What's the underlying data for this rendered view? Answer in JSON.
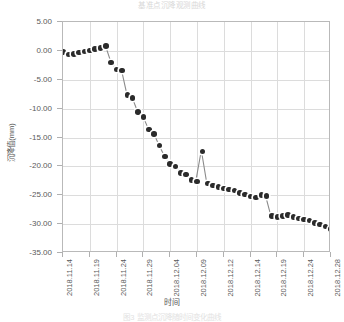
{
  "figure": {
    "title": "基准点沉降观测曲线",
    "caption": "图3 监测点沉降随时间变化曲线"
  },
  "axes": {
    "y_title": "沉降值(mm)",
    "x_title": "时间",
    "y_ticks": [
      "5.00",
      "0.00",
      "-5.00",
      "-10.00",
      "-15.00",
      "-20.00",
      "-25.00",
      "-30.00",
      "-35.00"
    ],
    "x_ticks": [
      "2018.11.14",
      "2018.11.19",
      "2018.11.24",
      "2018.11.29",
      "2018.12.04",
      "2018.12.09",
      "2018.12.12",
      "2018.12.14",
      "2018.12.19",
      "2018.12.24",
      "2018.12.28"
    ]
  },
  "style": {
    "marker_color": "#2b2b2b",
    "line_color": "#8a8a8a",
    "grid_color": "#dcdcdc",
    "frame_color": "#b9b9b9"
  },
  "chart_data": {
    "type": "scatter",
    "title": "基准点沉降观测曲线",
    "xlabel": "时间",
    "ylabel": "沉降值(mm)",
    "ylim": [
      -35.0,
      5.0
    ],
    "ytick_step": 5.0,
    "grid": true,
    "legend": "none",
    "categories": [
      "2018.11.14",
      "2018.11.19",
      "2018.11.24",
      "2018.11.29",
      "2018.12.04",
      "2018.12.09",
      "2018.12.12",
      "2018.12.14",
      "2018.12.19",
      "2018.12.24",
      "2018.12.28"
    ],
    "xlim": [
      0,
      50
    ],
    "series": [
      {
        "name": "沉降值",
        "x": [
          0,
          1,
          2,
          3,
          4,
          5,
          6,
          7,
          8,
          9,
          10,
          11,
          12,
          13,
          14,
          15,
          16,
          17,
          18,
          19,
          20,
          21,
          22,
          23,
          24,
          25,
          26,
          27,
          28,
          29,
          30,
          31,
          32,
          33,
          34,
          35,
          36,
          37,
          38,
          39,
          40,
          41,
          42,
          43,
          44,
          45,
          46,
          47,
          48,
          49,
          50
        ],
        "values": [
          -0.2,
          -0.6,
          -0.5,
          -0.3,
          -0.1,
          0.1,
          0.3,
          0.5,
          0.8,
          -2.0,
          -3.2,
          -3.4,
          -7.6,
          -8.2,
          -10.6,
          -11.4,
          -13.6,
          -14.4,
          -16.4,
          -18.3,
          -19.6,
          -20.0,
          -21.1,
          -21.4,
          -22.4,
          -22.6,
          -17.4,
          -23.0,
          -23.3,
          -23.6,
          -23.8,
          -24.0,
          -24.2,
          -24.6,
          -24.9,
          -25.2,
          -25.4,
          -25.0,
          -25.1,
          -28.6,
          -28.8,
          -28.6,
          -28.4,
          -28.8,
          -29.0,
          -29.2,
          -29.4,
          -29.8,
          -30.1,
          -30.4,
          -30.8
        ]
      }
    ]
  }
}
